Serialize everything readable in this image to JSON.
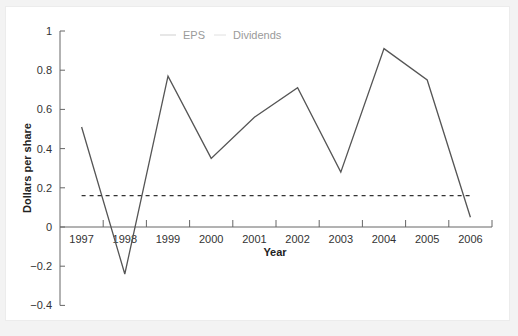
{
  "chart_data": {
    "type": "line",
    "title": "",
    "xlabel": "Year",
    "ylabel": "Dollars per share",
    "categories": [
      "1997",
      "1998",
      "1999",
      "2000",
      "2001",
      "2002",
      "2003",
      "2004",
      "2005",
      "2006"
    ],
    "series": [
      {
        "name": "EPS",
        "style": "solid",
        "values": [
          0.51,
          -0.24,
          0.77,
          0.35,
          0.56,
          0.71,
          0.28,
          0.91,
          0.75,
          0.05
        ]
      },
      {
        "name": "Dividends",
        "style": "dashed",
        "values": [
          0.16,
          0.16,
          0.16,
          0.16,
          0.16,
          0.16,
          0.16,
          0.16,
          0.16,
          0.16
        ]
      }
    ],
    "ylim": [
      -0.4,
      1.0
    ],
    "yticks": [
      "1",
      "0.8",
      "0.6",
      "0.4",
      "0.2",
      "0",
      "−0.2",
      "−0.4"
    ],
    "ytick_values": [
      1,
      0.8,
      0.6,
      0.4,
      0.2,
      0,
      -0.2,
      -0.4
    ],
    "grid": false,
    "legend_position": "top"
  },
  "legend": {
    "eps_label": "EPS",
    "dividends_label": "Dividends"
  },
  "colors": {
    "line": "#555555",
    "axis": "#666666",
    "legend": "#c8c8c8",
    "panel": "#ffffff",
    "background": "#f3f3f3"
  }
}
